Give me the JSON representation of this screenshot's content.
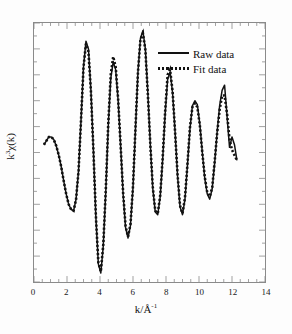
{
  "chart_data": {
    "type": "line",
    "title": "",
    "xlabel": "k/Å",
    "xlabel_sup": "-1",
    "ylabel_base": "k",
    "ylabel_sup": "3",
    "ylabel_rest": "χ(k)",
    "ylabel_full": "k3χ(k)",
    "xlim": [
      0,
      14
    ],
    "ylim": [
      -1.0,
      1.0
    ],
    "xticks": [
      0,
      2,
      4,
      6,
      8,
      10,
      12,
      14
    ],
    "xtick_labels": [
      "0",
      "2",
      "4",
      "6",
      "8",
      "10",
      "12",
      "14"
    ],
    "yticks_labeled": false,
    "grid": false,
    "legend_position": "top-right",
    "series": [
      {
        "name": "Raw data",
        "style": "solid",
        "color": "#111111",
        "x": [
          0.6,
          0.75,
          0.9,
          1.05,
          1.2,
          1.35,
          1.5,
          1.65,
          1.8,
          1.95,
          2.1,
          2.25,
          2.4,
          2.55,
          2.7,
          2.85,
          3.0,
          3.15,
          3.3,
          3.45,
          3.6,
          3.75,
          3.9,
          4.05,
          4.2,
          4.35,
          4.5,
          4.65,
          4.8,
          4.95,
          5.1,
          5.25,
          5.4,
          5.55,
          5.7,
          5.85,
          6.0,
          6.15,
          6.3,
          6.45,
          6.6,
          6.75,
          6.9,
          7.05,
          7.2,
          7.35,
          7.5,
          7.65,
          7.8,
          7.95,
          8.1,
          8.25,
          8.4,
          8.55,
          8.7,
          8.85,
          9.0,
          9.15,
          9.3,
          9.45,
          9.6,
          9.75,
          9.9,
          10.05,
          10.2,
          10.35,
          10.5,
          10.65,
          10.8,
          10.95,
          11.1,
          11.25,
          11.4,
          11.55,
          11.7,
          11.85,
          12.0,
          12.15,
          12.3
        ],
        "y": [
          0.06,
          0.09,
          0.12,
          0.12,
          0.1,
          0.05,
          -0.02,
          -0.11,
          -0.22,
          -0.32,
          -0.4,
          -0.44,
          -0.45,
          -0.36,
          -0.14,
          0.25,
          0.66,
          0.86,
          0.8,
          0.48,
          0.02,
          -0.5,
          -0.86,
          -0.93,
          -0.72,
          -0.3,
          0.2,
          0.57,
          0.7,
          0.64,
          0.4,
          0.05,
          -0.32,
          -0.58,
          -0.66,
          -0.56,
          -0.27,
          0.18,
          0.62,
          0.88,
          0.94,
          0.8,
          0.46,
          0.06,
          -0.28,
          -0.46,
          -0.48,
          -0.34,
          -0.05,
          0.3,
          0.57,
          0.62,
          0.46,
          0.16,
          -0.18,
          -0.42,
          -0.48,
          -0.36,
          -0.1,
          0.18,
          0.36,
          0.4,
          0.37,
          0.22,
          0.0,
          -0.2,
          -0.32,
          -0.36,
          -0.28,
          -0.08,
          0.16,
          0.36,
          0.48,
          0.52,
          0.28,
          0.04,
          0.12,
          0.06,
          -0.06
        ]
      },
      {
        "name": "Fit data",
        "style": "dotted",
        "color": "#111111",
        "x": [
          0.6,
          0.75,
          0.9,
          1.05,
          1.2,
          1.35,
          1.5,
          1.65,
          1.8,
          1.95,
          2.1,
          2.25,
          2.4,
          2.55,
          2.7,
          2.85,
          3.0,
          3.15,
          3.3,
          3.45,
          3.6,
          3.75,
          3.9,
          4.05,
          4.2,
          4.35,
          4.5,
          4.65,
          4.8,
          4.95,
          5.1,
          5.25,
          5.4,
          5.55,
          5.7,
          5.85,
          6.0,
          6.15,
          6.3,
          6.45,
          6.6,
          6.75,
          6.9,
          7.05,
          7.2,
          7.35,
          7.5,
          7.65,
          7.8,
          7.95,
          8.1,
          8.25,
          8.4,
          8.55,
          8.7,
          8.85,
          9.0,
          9.15,
          9.3,
          9.45,
          9.6,
          9.75,
          9.9,
          10.05,
          10.2,
          10.35,
          10.5,
          10.65,
          10.8,
          10.95,
          11.1,
          11.25,
          11.4,
          11.55,
          11.7,
          11.85,
          12.0,
          12.15,
          12.3
        ],
        "y": [
          0.06,
          0.09,
          0.12,
          0.12,
          0.1,
          0.05,
          -0.02,
          -0.11,
          -0.22,
          -0.32,
          -0.4,
          -0.44,
          -0.45,
          -0.36,
          -0.14,
          0.25,
          0.66,
          0.84,
          0.78,
          0.47,
          0.02,
          -0.49,
          -0.85,
          -0.92,
          -0.71,
          -0.29,
          0.22,
          0.6,
          0.74,
          0.66,
          0.41,
          0.05,
          -0.31,
          -0.57,
          -0.65,
          -0.55,
          -0.26,
          0.19,
          0.62,
          0.87,
          0.92,
          0.79,
          0.45,
          0.06,
          -0.27,
          -0.45,
          -0.47,
          -0.33,
          -0.04,
          0.32,
          0.6,
          0.64,
          0.47,
          0.16,
          -0.17,
          -0.41,
          -0.47,
          -0.35,
          -0.09,
          0.19,
          0.35,
          0.38,
          0.35,
          0.21,
          0.0,
          -0.19,
          -0.31,
          -0.34,
          -0.27,
          -0.07,
          0.15,
          0.33,
          0.44,
          0.44,
          0.3,
          0.1,
          0.02,
          -0.02,
          -0.06
        ]
      }
    ]
  },
  "legend": {
    "items": [
      {
        "label": "Raw data",
        "style": "solid"
      },
      {
        "label": "Fit data",
        "style": "dotted"
      }
    ]
  }
}
